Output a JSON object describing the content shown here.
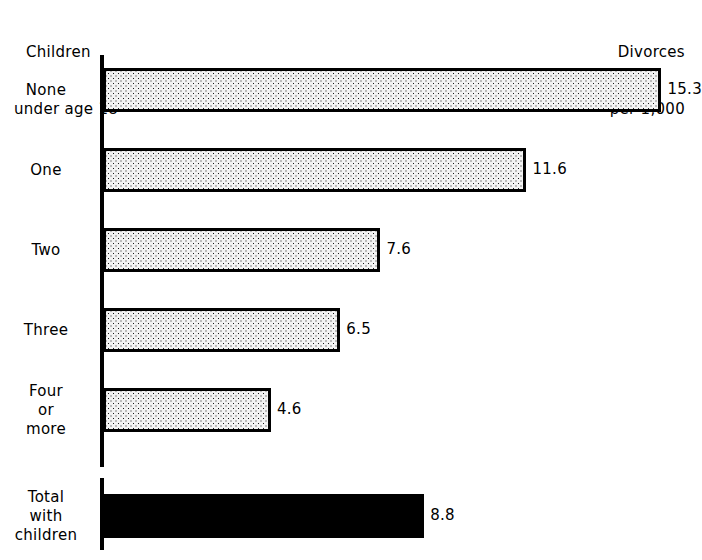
{
  "header": {
    "left_line1": "Children",
    "left_line2": "under age 18",
    "right_line1": "Divorces",
    "right_line2": "per 1,000"
  },
  "chart_data": {
    "type": "bar",
    "orientation": "horizontal",
    "title": "",
    "xlabel": "Divorces per 1,000",
    "ylabel": "Children under age 18",
    "grid": false,
    "legend": null,
    "xlim": [
      0,
      16
    ],
    "categories": [
      "None",
      "One",
      "Two",
      "Three",
      "Four or more",
      "Total with children"
    ],
    "values": [
      15.3,
      11.6,
      7.6,
      6.5,
      4.6,
      8.8
    ],
    "value_labels": [
      "15.3",
      "11.6",
      "7.6",
      "6.5",
      "4.6",
      "8.8"
    ],
    "bars": [
      {
        "category": "None",
        "label_lines": [
          "None"
        ],
        "value": 15.3,
        "value_label": "15.3",
        "fill": "stipple"
      },
      {
        "category": "One",
        "label_lines": [
          "One"
        ],
        "value": 11.6,
        "value_label": "11.6",
        "fill": "stipple"
      },
      {
        "category": "Two",
        "label_lines": [
          "Two"
        ],
        "value": 7.6,
        "value_label": "7.6",
        "fill": "stipple"
      },
      {
        "category": "Three",
        "label_lines": [
          "Three"
        ],
        "value": 6.5,
        "value_label": "6.5",
        "fill": "stipple"
      },
      {
        "category": "Four or more",
        "label_lines": [
          "Four",
          "or",
          "more"
        ],
        "value": 4.6,
        "value_label": "4.6",
        "fill": "stipple"
      },
      {
        "category": "Total with children",
        "label_lines": [
          "Total",
          "with",
          "children"
        ],
        "value": 8.8,
        "value_label": "8.8",
        "fill": "solid"
      }
    ],
    "colors": {
      "bar_outline": "#000000",
      "bar_fill_stipple": "#f2f2f2",
      "bar_fill_solid": "#000000",
      "background": "#ffffff",
      "text": "#000000"
    }
  }
}
